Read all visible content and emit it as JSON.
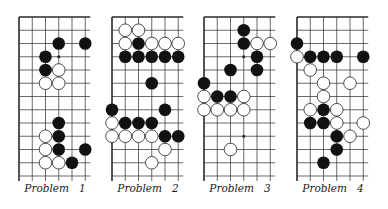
{
  "figure": {
    "grid": {
      "cols": 6,
      "rows": 13,
      "spacing": 13.25,
      "top": 17,
      "extend_right": 5,
      "extend_bottom": 5,
      "stone_radius": 6.3,
      "line_color": "#2a2a2a",
      "black_color": "#111111",
      "white_color": "#ffffff"
    },
    "problems": [
      {
        "label": "Problem   1",
        "left": 19,
        "label_center": 55,
        "black": [
          [
            3,
            2
          ],
          [
            5,
            2
          ],
          [
            2,
            3
          ],
          [
            2,
            4
          ],
          [
            3,
            8
          ],
          [
            3,
            9
          ],
          [
            3,
            10
          ],
          [
            5,
            10
          ],
          [
            4,
            11
          ]
        ],
        "white": [
          [
            3,
            4
          ],
          [
            2,
            5
          ],
          [
            3,
            5
          ],
          [
            2,
            9
          ],
          [
            2,
            10
          ],
          [
            2,
            11
          ],
          [
            3,
            11
          ]
        ],
        "dots": [
          [
            3,
            3
          ]
        ]
      },
      {
        "label": "Problem   2",
        "left": 112,
        "label_center": 148,
        "black": [
          [
            2,
            2
          ],
          [
            1,
            3
          ],
          [
            2,
            3
          ],
          [
            3,
            3
          ],
          [
            4,
            3
          ],
          [
            5,
            3
          ],
          [
            3,
            5
          ],
          [
            0,
            7
          ],
          [
            4,
            7
          ],
          [
            1,
            8
          ],
          [
            2,
            8
          ],
          [
            3,
            8
          ],
          [
            4,
            9
          ],
          [
            5,
            9
          ]
        ],
        "white": [
          [
            1,
            1
          ],
          [
            2,
            1
          ],
          [
            1,
            2
          ],
          [
            3,
            2
          ],
          [
            4,
            2
          ],
          [
            5,
            2
          ],
          [
            0,
            8
          ],
          [
            0,
            9
          ],
          [
            1,
            9
          ],
          [
            2,
            9
          ],
          [
            3,
            9
          ],
          [
            4,
            10
          ],
          [
            3,
            11
          ]
        ],
        "dots": []
      },
      {
        "label": "Problem   3",
        "left": 204,
        "label_center": 240,
        "black": [
          [
            3,
            1
          ],
          [
            3,
            2
          ],
          [
            4,
            3
          ],
          [
            2,
            4
          ],
          [
            4,
            4
          ],
          [
            0,
            5
          ],
          [
            1,
            6
          ],
          [
            2,
            6
          ]
        ],
        "white": [
          [
            4,
            2
          ],
          [
            5,
            2
          ],
          [
            0,
            6
          ],
          [
            3,
            6
          ],
          [
            0,
            7
          ],
          [
            1,
            7
          ],
          [
            2,
            7
          ],
          [
            3,
            7
          ],
          [
            2,
            10
          ]
        ],
        "dots": [
          [
            3,
            3
          ],
          [
            3,
            9
          ]
        ]
      },
      {
        "label": "Problem   4",
        "left": 297,
        "label_center": 333,
        "black": [
          [
            0,
            2
          ],
          [
            1,
            3
          ],
          [
            2,
            3
          ],
          [
            3,
            3
          ],
          [
            5,
            3
          ],
          [
            2,
            7
          ],
          [
            1,
            8
          ],
          [
            2,
            8
          ],
          [
            3,
            9
          ],
          [
            3,
            10
          ],
          [
            2,
            11
          ]
        ],
        "white": [
          [
            0,
            3
          ],
          [
            1,
            4
          ],
          [
            2,
            5
          ],
          [
            4,
            5
          ],
          [
            2,
            6
          ],
          [
            1,
            7
          ],
          [
            3,
            7
          ],
          [
            3,
            8
          ],
          [
            5,
            8
          ],
          [
            4,
            9
          ]
        ],
        "dots": []
      }
    ]
  }
}
